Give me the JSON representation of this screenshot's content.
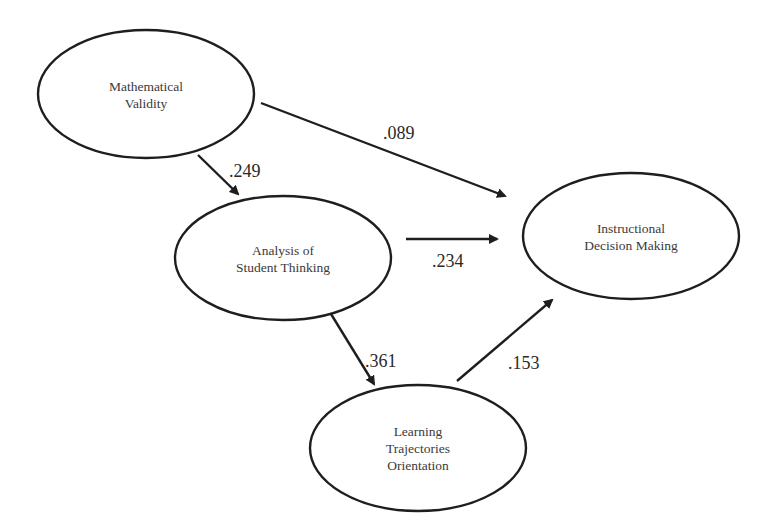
{
  "diagram": {
    "type": "path-model",
    "colors": {
      "stroke": "#1e1e1e",
      "node_text": "#3a3a3a",
      "label_text": "#2a2a2a",
      "background": "#ffffff"
    },
    "nodes": [
      {
        "id": "mv",
        "lines": [
          "Mathematical",
          "Validity"
        ],
        "cx": 146,
        "cy": 94,
        "rx": 108,
        "ry": 64
      },
      {
        "id": "ast",
        "lines": [
          "Analysis of",
          "Student Thinking"
        ],
        "cx": 283,
        "cy": 258,
        "rx": 108,
        "ry": 62
      },
      {
        "id": "idm",
        "lines": [
          "Instructional",
          "Decision Making"
        ],
        "cx": 631,
        "cy": 236,
        "rx": 108,
        "ry": 63
      },
      {
        "id": "lto",
        "lines": [
          "Learning",
          "Trajectories",
          "Orientation"
        ],
        "cx": 418,
        "cy": 448,
        "rx": 108,
        "ry": 63
      }
    ],
    "edges": [
      {
        "from": "mv",
        "to": "ast",
        "coefficient": ".249",
        "x1": 198,
        "y1": 155,
        "x2": 238,
        "y2": 194,
        "label_x": 229,
        "label_y": 177
      },
      {
        "from": "mv",
        "to": "idm",
        "coefficient": ".089",
        "x1": 261,
        "y1": 103,
        "x2": 505,
        "y2": 196,
        "label_x": 383,
        "label_y": 139
      },
      {
        "from": "ast",
        "to": "idm",
        "coefficient": ".234",
        "x1": 406,
        "y1": 239,
        "x2": 497,
        "y2": 239,
        "label_x": 432,
        "label_y": 267
      },
      {
        "from": "ast",
        "to": "lto",
        "coefficient": ".361",
        "x1": 331,
        "y1": 314,
        "x2": 374,
        "y2": 384,
        "label_x": 365,
        "label_y": 367
      },
      {
        "from": "lto",
        "to": "idm",
        "coefficient": ".153",
        "x1": 457,
        "y1": 381,
        "x2": 552,
        "y2": 300,
        "label_x": 508,
        "label_y": 369
      }
    ]
  }
}
